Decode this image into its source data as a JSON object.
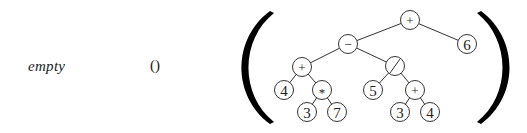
{
  "left_labels": {
    "empty": "empty",
    "unit": "()"
  },
  "tree": {
    "nodes": [
      {
        "id": "root",
        "label": "+",
        "kind": "operator"
      },
      {
        "id": "n6",
        "label": "6",
        "kind": "number"
      },
      {
        "id": "minus",
        "label": "−",
        "kind": "operator"
      },
      {
        "id": "plusL",
        "label": "+",
        "kind": "operator"
      },
      {
        "id": "div",
        "label": "/",
        "kind": "operator"
      },
      {
        "id": "n4a",
        "label": "4",
        "kind": "number"
      },
      {
        "id": "mul",
        "label": "*",
        "kind": "operator"
      },
      {
        "id": "n5",
        "label": "5",
        "kind": "number"
      },
      {
        "id": "plusR",
        "label": "+",
        "kind": "operator"
      },
      {
        "id": "n3a",
        "label": "3",
        "kind": "number"
      },
      {
        "id": "n7",
        "label": "7",
        "kind": "number"
      },
      {
        "id": "n3b",
        "label": "3",
        "kind": "number"
      },
      {
        "id": "n4b",
        "label": "4",
        "kind": "number"
      }
    ],
    "edges": [
      [
        "root",
        "minus"
      ],
      [
        "root",
        "n6"
      ],
      [
        "minus",
        "plusL"
      ],
      [
        "minus",
        "div"
      ],
      [
        "plusL",
        "n4a"
      ],
      [
        "plusL",
        "mul"
      ],
      [
        "mul",
        "n3a"
      ],
      [
        "mul",
        "n7"
      ],
      [
        "div",
        "n5"
      ],
      [
        "div",
        "plusR"
      ],
      [
        "plusR",
        "n3b"
      ],
      [
        "plusR",
        "n4b"
      ]
    ]
  },
  "brackets": {
    "open": "(",
    "close": ")"
  }
}
